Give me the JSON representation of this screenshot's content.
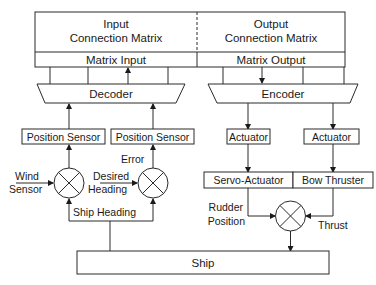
{
  "diagram": {
    "input_matrix": {
      "line1": "Input",
      "line2": "Connection Matrix"
    },
    "output_matrix": {
      "line1": "Output",
      "line2": "Connection Matrix"
    },
    "matrix_input": "Matrix Input",
    "matrix_output": "Matrix Output",
    "decoder": "Decoder",
    "encoder": "Encoder",
    "position_sensor_left": "Position Sensor",
    "position_sensor_right": "Position Sensor",
    "actuator_left": "Actuator",
    "actuator_right": "Actuator",
    "servo_actuator": "Servo-Actuator",
    "bow_thruster": "Bow Thruster",
    "wind_sensor": {
      "line1": "Wind",
      "line2": "Sensor"
    },
    "desired_heading": {
      "line1": "Desired",
      "line2": "Heading"
    },
    "error": "Error",
    "ship_heading": "Ship Heading",
    "rudder_position": {
      "line1": "Rudder",
      "line2": "Position"
    },
    "thrust": "Thrust",
    "ship": "Ship"
  }
}
